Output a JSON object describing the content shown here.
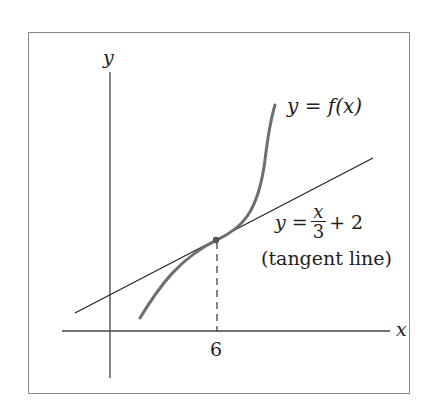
{
  "diagram": {
    "type": "function-tangent-line",
    "axes": {
      "x_label": "x",
      "y_label": "y"
    },
    "curve": {
      "label": "y = f(x)",
      "color": "#6e6e6e"
    },
    "tangent": {
      "label_lhs": "y =",
      "label_num": "x",
      "label_den": "3",
      "label_rhs": "+ 2",
      "caption": "(tangent line)",
      "color": "#222222"
    },
    "tick": {
      "x_value": "6"
    },
    "tangent_point": {
      "x": 6,
      "y": 4
    }
  }
}
